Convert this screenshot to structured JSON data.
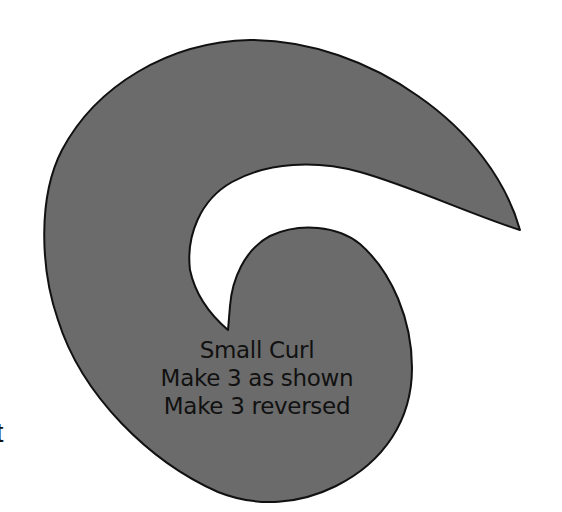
{
  "pattern": {
    "name": "Small Curl",
    "instructions": [
      "Make 3 as shown",
      "Make 3 reversed"
    ],
    "fill_color": "#6b6b6b",
    "stroke_color": "#111111",
    "background": "#ffffff"
  },
  "edge_fragment_text": "t"
}
